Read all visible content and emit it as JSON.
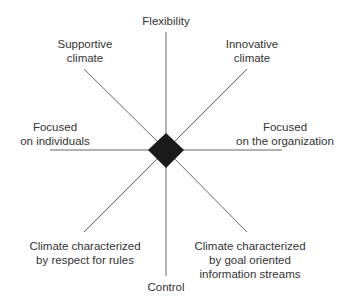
{
  "diagram": {
    "axes": {
      "top": "Flexibility",
      "bottom": "Control",
      "left": [
        "Focused",
        "on individuals"
      ],
      "right": [
        "Focused",
        "on the organization"
      ]
    },
    "quadrants": {
      "top_left": [
        "Supportive",
        "climate"
      ],
      "top_right": [
        "Innovative",
        "climate"
      ],
      "bottom_left": [
        "Climate characterized",
        "by respect for rules"
      ],
      "bottom_right": [
        "Climate characterized",
        "by goal oriented",
        "information streams"
      ]
    },
    "colors": {
      "line": "#555555",
      "center": "#1a1a1a"
    }
  }
}
